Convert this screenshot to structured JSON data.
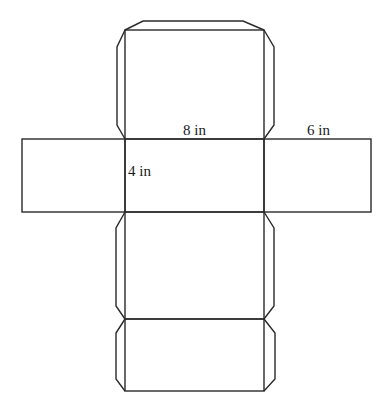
{
  "diagram": {
    "dimensions": {
      "length": {
        "value": 8,
        "unit": "in",
        "label": "8 in"
      },
      "height": {
        "value": 4,
        "unit": "in",
        "label": "4 in"
      },
      "width": {
        "value": 6,
        "unit": "in",
        "label": "6 in"
      }
    },
    "faces": [
      {
        "name": "top-face",
        "dims": "8 in × 6 in"
      },
      {
        "name": "front-face",
        "dims": "8 in × 4 in"
      },
      {
        "name": "left-face",
        "dims": "6 in × 4 in"
      },
      {
        "name": "right-face",
        "dims": "6 in × 4 in"
      },
      {
        "name": "bottom-face",
        "dims": "8 in × 6 in"
      },
      {
        "name": "back-face",
        "dims": "8 in × 4 in"
      }
    ],
    "colors": {
      "line": "#2a2a2a",
      "background": "#ffffff",
      "text": "#1a1a1a"
    }
  }
}
